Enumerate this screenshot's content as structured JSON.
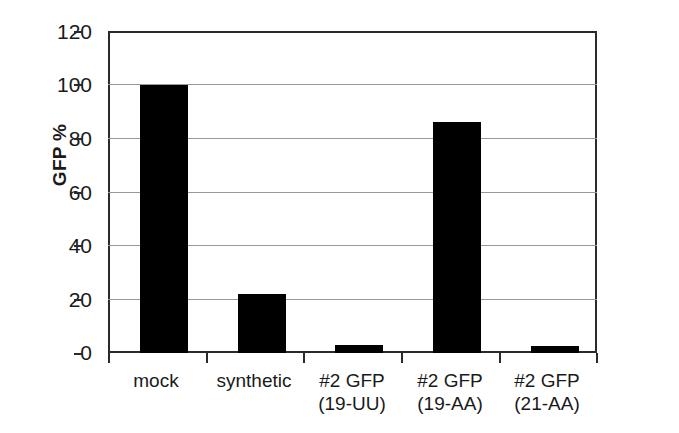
{
  "chart_data": {
    "type": "bar",
    "title": "",
    "xlabel": "",
    "ylabel": "GFP %",
    "ylim": [
      0,
      120
    ],
    "yticks": [
      0,
      20,
      40,
      60,
      80,
      100,
      120
    ],
    "ytick_labels": [
      "0",
      "20",
      "40",
      "60",
      "80",
      "100",
      "120"
    ],
    "grid": "horizontal",
    "legend": "none",
    "bar_color": "#000000",
    "categories": [
      "mock",
      "synthetic",
      "#2 GFP (19-UU)",
      "#2 GFP (19-AA)",
      "#2 GFP (21-AA)"
    ],
    "category_lines": [
      {
        "line1": "mock",
        "line2": ""
      },
      {
        "line1": "synthetic",
        "line2": ""
      },
      {
        "line1": "#2 GFP",
        "line2": "(19-UU)"
      },
      {
        "line1": "#2 GFP",
        "line2": "(19-AA)"
      },
      {
        "line1": "#2 GFP",
        "line2": "(21-AA)"
      }
    ],
    "values": [
      100,
      22,
      3,
      86,
      2.5
    ]
  }
}
